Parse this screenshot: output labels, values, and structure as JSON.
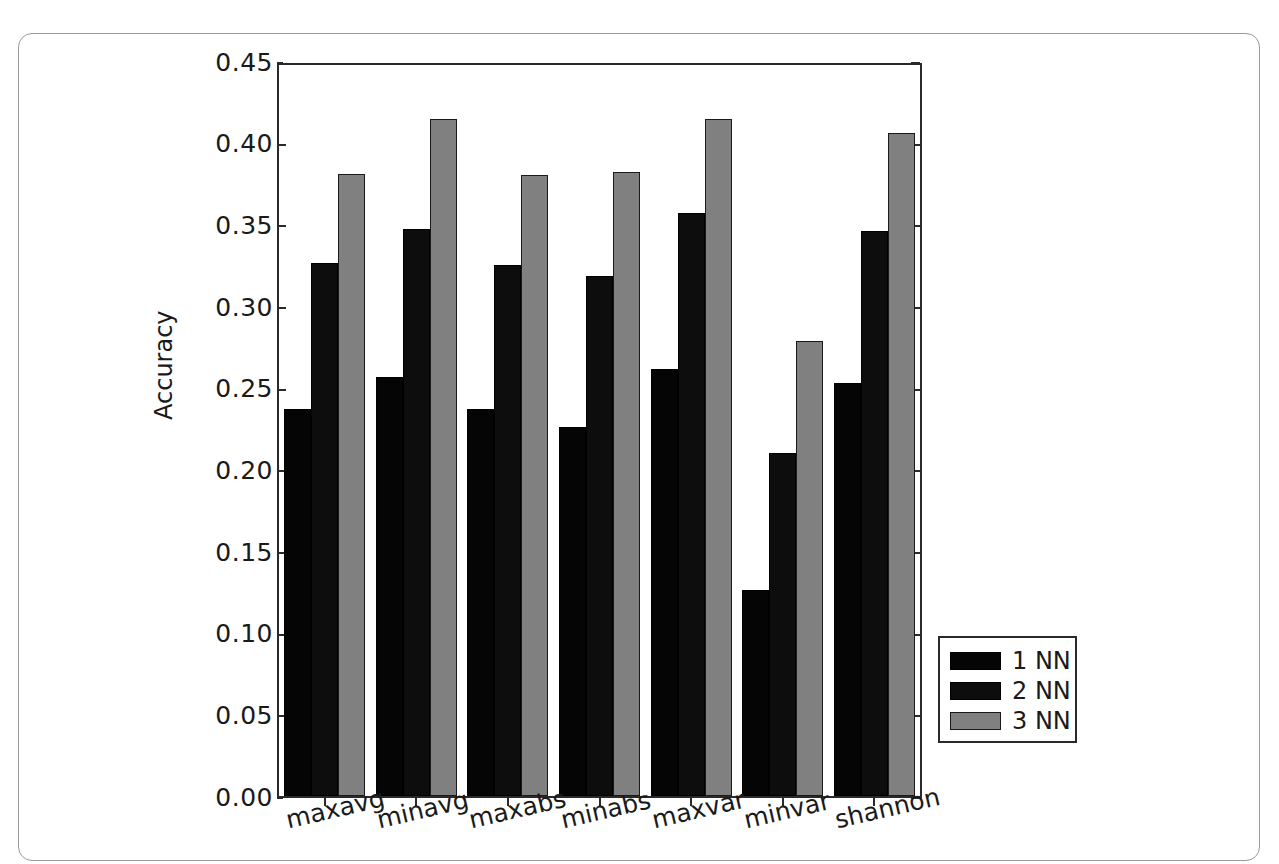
{
  "chart_data": {
    "type": "bar",
    "title": "",
    "xlabel": "",
    "ylabel": "Accuracy",
    "categories": [
      "maxavg",
      "minavg",
      "maxabs",
      "minabs",
      "maxvar",
      "minvar",
      "shannon"
    ],
    "series": [
      {
        "name": "1 NN",
        "color": "#050505",
        "values": [
          0.238,
          0.258,
          0.238,
          0.227,
          0.263,
          0.127,
          0.254
        ]
      },
      {
        "name": "2 NN",
        "color": "#0d0d0d",
        "values": [
          0.328,
          0.349,
          0.327,
          0.32,
          0.359,
          0.211,
          0.348
        ]
      },
      {
        "name": "3 NN",
        "color": "#808080",
        "values": [
          0.383,
          0.417,
          0.382,
          0.384,
          0.417,
          0.28,
          0.408
        ]
      }
    ],
    "ylim": [
      0.0,
      0.45
    ],
    "y_ticks": [
      "0.00",
      "0.05",
      "0.10",
      "0.15",
      "0.20",
      "0.25",
      "0.30",
      "0.35",
      "0.40",
      "0.45"
    ],
    "y_tick_values": [
      0.0,
      0.05,
      0.1,
      0.15,
      0.2,
      0.25,
      0.3,
      0.35,
      0.4,
      0.45
    ],
    "grid": false,
    "legend_position": "right-outside",
    "legend_entries": [
      "1 NN",
      "2 NN",
      "3 NN"
    ],
    "x_tick_rotation": -13
  }
}
